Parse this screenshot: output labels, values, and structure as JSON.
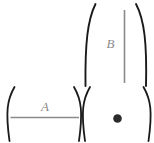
{
  "figure": {
    "background_color": "#ffffff",
    "width": 154,
    "height": 143,
    "paren_color": "#1a1a1a",
    "line_color": "#8a8a8a",
    "dot_color": "#2b2b2b",
    "groups": [
      {
        "id": "group-b",
        "name": "vertical-measure-group",
        "label": "B",
        "content": "vertical-line",
        "position": "top-right"
      },
      {
        "id": "group-a",
        "name": "horizontal-measure-group",
        "label": "A",
        "content": "horizontal-line",
        "position": "bottom-left"
      },
      {
        "id": "group-dot",
        "name": "point-group",
        "label": "",
        "content": "dot",
        "position": "bottom-right"
      }
    ]
  },
  "labels": {
    "b": "B",
    "a": "A"
  }
}
